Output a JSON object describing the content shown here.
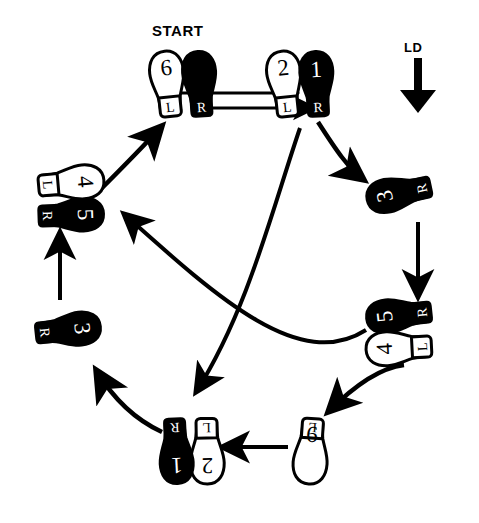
{
  "diagram": {
    "title": "START",
    "direction_label": "LD",
    "direction_icon": "down-arrow-icon",
    "type": "dance-step-footprint-chart",
    "colors": {
      "ink": "#000000",
      "paper": "#ffffff",
      "fill_black": "#000000",
      "fill_white": "#ffffff"
    },
    "legend": {
      "left_foot": "L",
      "right_foot": "R"
    },
    "footprints": [
      {
        "id": "start-left-6",
        "step": "6",
        "foot": "L",
        "shade": "white",
        "position": "top-center-left",
        "heel_tag": "L"
      },
      {
        "id": "start-right",
        "step": "",
        "foot": "R",
        "shade": "black",
        "position": "top-center-right",
        "heel_tag": "R"
      },
      {
        "id": "top-right-2",
        "step": "2",
        "foot": "L",
        "shade": "white",
        "position": "top-right-left",
        "heel_tag": "L"
      },
      {
        "id": "top-right-1",
        "step": "1",
        "foot": "R",
        "shade": "black",
        "position": "top-right-right",
        "heel_tag": "R"
      },
      {
        "id": "right-3",
        "step": "3",
        "foot": "R",
        "shade": "black",
        "position": "right-upper",
        "heel_tag": "R"
      },
      {
        "id": "right-5",
        "step": "5",
        "foot": "R",
        "shade": "black",
        "position": "right-lower-top",
        "heel_tag": "R"
      },
      {
        "id": "right-4",
        "step": "4",
        "foot": "L",
        "shade": "white",
        "position": "right-lower-bottom",
        "heel_tag": "L"
      },
      {
        "id": "bottom-6",
        "step": "6",
        "foot": "L",
        "shade": "white",
        "position": "bottom-right",
        "heel_tag": "L"
      },
      {
        "id": "bottom-2",
        "step": "2",
        "foot": "L",
        "shade": "white",
        "position": "bottom-center-right",
        "heel_tag": "L"
      },
      {
        "id": "bottom-1",
        "step": "1",
        "foot": "R",
        "shade": "black",
        "position": "bottom-center-left",
        "heel_tag": "R"
      },
      {
        "id": "left-3",
        "step": "3",
        "foot": "R",
        "shade": "black",
        "position": "left-lower",
        "heel_tag": "R"
      },
      {
        "id": "left-5",
        "step": "5",
        "foot": "R",
        "shade": "black",
        "position": "left-upper-bottom",
        "heel_tag": "R"
      },
      {
        "id": "left-4",
        "step": "4",
        "foot": "L",
        "shade": "white",
        "position": "left-upper-top",
        "heel_tag": "L"
      }
    ],
    "arrows": [
      {
        "id": "start-to-1-upper",
        "kind": "straight",
        "from": "start-pair",
        "to": "top-right-pair"
      },
      {
        "id": "start-to-1-lower",
        "kind": "straight",
        "from": "start-pair",
        "to": "top-right-pair"
      },
      {
        "id": "one-to-three",
        "kind": "curved",
        "from": "top-right-1",
        "to": "right-3"
      },
      {
        "id": "three-to-five",
        "kind": "straight",
        "from": "right-3",
        "to": "right-5"
      },
      {
        "id": "five-to-six",
        "kind": "curved",
        "from": "right-4",
        "to": "bottom-6"
      },
      {
        "id": "six-to-two",
        "kind": "straight",
        "from": "bottom-6",
        "to": "bottom-2"
      },
      {
        "id": "two-to-three-left",
        "kind": "curved",
        "from": "bottom-1",
        "to": "left-3"
      },
      {
        "id": "three-to-five-left",
        "kind": "straight",
        "from": "left-3",
        "to": "left-5"
      },
      {
        "id": "four-to-start",
        "kind": "curved",
        "from": "left-4",
        "to": "start-pair"
      },
      {
        "id": "diag-top-to-bottom",
        "kind": "curved",
        "from": "top-right-pair",
        "to": "bottom-center-pair"
      },
      {
        "id": "diag-bottom-to-left",
        "kind": "curved",
        "from": "right-lower-pair",
        "to": "left-upper-pair"
      }
    ]
  }
}
